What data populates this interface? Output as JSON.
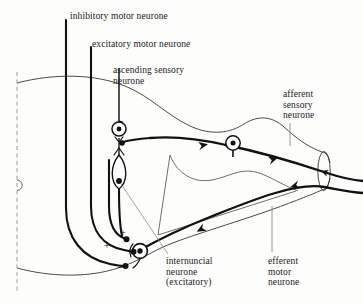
{
  "figure": {
    "background_color": "#fdfdfc",
    "ink_color": "#1a1a1a"
  },
  "labels": {
    "inhibitory_motor_neurone": "inhibitory motor neurone",
    "excitatory_motor_neurone": "excitatory motor neurone",
    "ascending_sensory_neurone": "ascending sensory\nneurone",
    "afferent_sensory_neurone": "afferent\nsensory\nneurone",
    "internuncial_neurone": "internuncial\nneurone\n(excitatory)",
    "efferent_motor_neurone": "efferent\nmotor\nneurone"
  },
  "synapse_signs": {
    "plus_upper": "+",
    "plus_lower": "+",
    "minus": "–"
  },
  "structures": {
    "midline": "dashed-midline",
    "central_canal": "central-canal-semicircle",
    "grey_matter": "grey-matter-butterfly",
    "spinal_nerve": "spinal-nerve-trunk",
    "dorsal_root_ganglion": "dorsal-root-ganglion-cell",
    "ascending_cell_body": "ascending-neurone-cell-body",
    "internuncial_cell_body": "internuncial-neurone-cell-body",
    "motor_cell_body": "motor-neurone-cell-body"
  }
}
